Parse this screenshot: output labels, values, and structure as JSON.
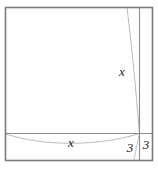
{
  "figure": {
    "background_color": "#ffffff",
    "outer_frame": {
      "name": "outer-square-border",
      "x": 5.5,
      "y": 7.5,
      "width": 147,
      "height": 153,
      "stroke_color": "#7a7a7a",
      "stroke_width": 1.6
    },
    "vertical_divider": {
      "name": "vertical-divider-line",
      "x": 139.5,
      "y1": 7.5,
      "y2": 160.5,
      "stroke_color": "#8d8d8d",
      "stroke_width": 1.1
    },
    "horizontal_divider": {
      "name": "horizontal-divider-line",
      "y": 133.5,
      "x1": 5.5,
      "x2": 152.5,
      "stroke_color": "#8d8d8d",
      "stroke_width": 1.1
    },
    "arc_vertical": {
      "name": "vertical-arc-curve",
      "path": "M 127 8 C 133 55 137 105 139.5 133.5",
      "stroke_color": "#b9b9b9",
      "stroke_width": 1.0
    },
    "arc_vertical_lower": {
      "name": "vertical-arc-curve-lower",
      "path": "M 139.5 133.5 C 137.5 143 135.5 152 134 160",
      "stroke_color": "#c6c6c6",
      "stroke_width": 1.0
    },
    "arc_horizontal": {
      "name": "horizontal-arc-curve",
      "path": "M 6 134 C 45 147 100 146 139.5 133.5",
      "stroke_color": "#bcbcbc",
      "stroke_width": 1.0
    },
    "labels": [
      {
        "name": "label-x-vertical",
        "text": "x",
        "x": 122,
        "y": 76,
        "role": "height of main square"
      },
      {
        "name": "label-x-horizontal",
        "text": "x",
        "x": 71,
        "y": 147,
        "role": "width of main square"
      },
      {
        "name": "label-3-bottom-strip",
        "text": "3",
        "x": 130,
        "y": 152,
        "role": "height of bottom strip"
      },
      {
        "name": "label-3-right-strip",
        "text": "3",
        "x": 146,
        "y": 149,
        "role": "width of right strip"
      }
    ]
  }
}
